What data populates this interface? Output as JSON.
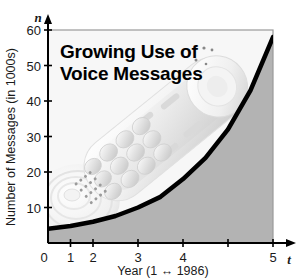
{
  "figure": {
    "title_line1": "Growing Use of",
    "title_line2": "Voice Messages",
    "background_photo": "cordless-telephone-handset",
    "colors": {
      "curve": "#000000",
      "shaded_region": "#b3b3b3",
      "plot_background": "#f7f7f7",
      "frame": "#9a9a9a",
      "axis": "#000000",
      "text": "#1a1a1a"
    }
  },
  "chart_data": {
    "type": "line",
    "title": "Growing Use of Voice Messages",
    "xlabel": "Year (1 ↔ 1986)",
    "ylabel": "Number of Messages (in 1000s)",
    "x_axis_symbol": "t",
    "y_axis_symbol": "n",
    "xlim": [
      0,
      5
    ],
    "ylim": [
      0,
      60
    ],
    "grid": false,
    "legend": null,
    "x_ticks": [
      0,
      1,
      2,
      3,
      4,
      5
    ],
    "x_tick_labels": [
      "0",
      "1",
      "2",
      "3",
      "4",
      "5"
    ],
    "y_ticks": [
      10,
      20,
      30,
      40,
      50,
      60
    ],
    "y_tick_labels": [
      "10",
      "20",
      "30",
      "40",
      "50",
      "60"
    ],
    "series": [
      {
        "name": "Voice messages",
        "shape": "exponential-growth",
        "shaded_below": true,
        "x": [
          0,
          0.5,
          1,
          1.5,
          2,
          2.5,
          3,
          3.5,
          4,
          4.5,
          5
        ],
        "values": [
          4,
          4.8,
          6,
          7.6,
          10,
          13,
          18,
          24,
          32,
          43,
          58
        ]
      }
    ]
  }
}
